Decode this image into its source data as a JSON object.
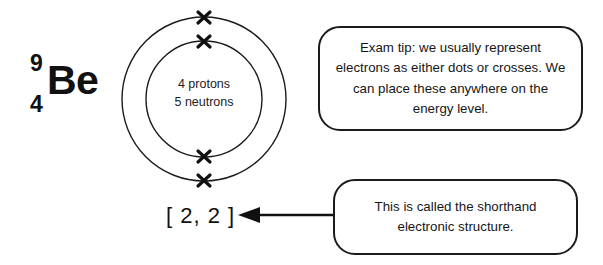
{
  "diagram": {
    "isotope": {
      "mass_number": "9",
      "atomic_number": "4",
      "element_symbol": "Be"
    },
    "atom": {
      "nucleus_line_1": "4 protons",
      "nucleus_line_2": "5 neutrons",
      "shells": [
        {
          "name": "inner-shell",
          "electrons": 2
        },
        {
          "name": "outer-shell",
          "electrons": 2
        }
      ],
      "electron_marker": "cross"
    },
    "shorthand": {
      "notation": "[ 2, 2 ]"
    },
    "callouts": [
      {
        "id": "exam-tip",
        "text": "Exam tip: we usually represent electrons as either dots or crosses. We can place these anywhere on the energy level."
      },
      {
        "id": "shorthand-explanation",
        "text": "This is called the shorthand electronic structure."
      }
    ],
    "colors": {
      "line": "#1b1b1b",
      "text": "#161616",
      "background": "#ffffff"
    }
  }
}
